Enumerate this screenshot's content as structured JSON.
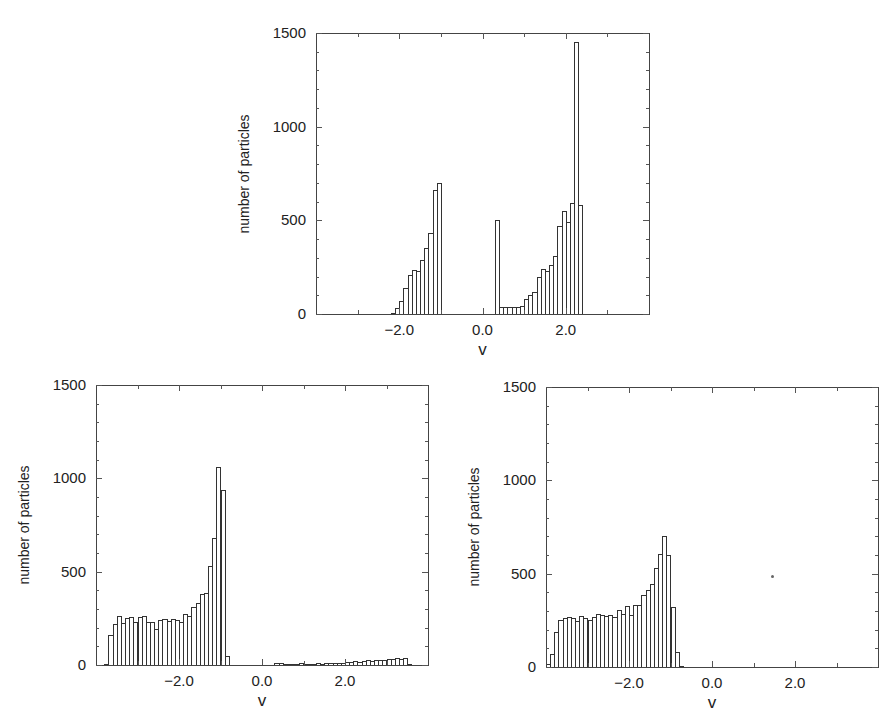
{
  "chart_data": [
    {
      "id": "top",
      "type": "bar",
      "title": "",
      "xlabel": "v",
      "ylabel": "number of particles",
      "xlim": [
        -4,
        4
      ],
      "ylim": [
        0,
        1500
      ],
      "grid": false,
      "xticks": [
        -2.0,
        0.0,
        2.0
      ],
      "xtick_labels": [
        "−2.0",
        "0.0",
        "2.0"
      ],
      "yticks": [
        0,
        500,
        1000,
        1500
      ],
      "ytick_labels": [
        "0",
        "500",
        "1000",
        "1500"
      ],
      "bin_width": 0.1,
      "frame_px": {
        "left": 316,
        "top": 33,
        "right": 649,
        "bottom": 314
      },
      "x": [
        -2.15,
        -2.05,
        -1.95,
        -1.85,
        -1.75,
        -1.65,
        -1.55,
        -1.45,
        -1.35,
        -1.25,
        -1.15,
        -1.05,
        0.35,
        0.45,
        0.55,
        0.65,
        0.75,
        0.85,
        0.95,
        1.05,
        1.15,
        1.25,
        1.35,
        1.45,
        1.55,
        1.65,
        1.75,
        1.85,
        1.95,
        2.05,
        2.15,
        2.25,
        2.35
      ],
      "values": [
        5,
        30,
        70,
        140,
        210,
        235,
        230,
        290,
        350,
        430,
        660,
        700,
        500,
        40,
        38,
        40,
        40,
        40,
        45,
        80,
        100,
        120,
        200,
        240,
        230,
        260,
        310,
        470,
        550,
        490,
        590,
        1450,
        580
      ]
    },
    {
      "id": "bottom-left",
      "type": "bar",
      "title": "",
      "xlabel": "v",
      "ylabel": "number of particles",
      "xlim": [
        -4,
        4
      ],
      "ylim": [
        0,
        1500
      ],
      "grid": false,
      "xticks": [
        -2.0,
        0.0,
        2.0
      ],
      "xtick_labels": [
        "−2.0",
        "0.0",
        "2.0"
      ],
      "yticks": [
        0,
        500,
        1000,
        1500
      ],
      "ytick_labels": [
        "0",
        "500",
        "1000",
        "1500"
      ],
      "bin_width": 0.1,
      "frame_px": {
        "left": 96,
        "top": 385,
        "right": 428,
        "bottom": 665
      },
      "x": [
        -3.75,
        -3.65,
        -3.55,
        -3.45,
        -3.35,
        -3.25,
        -3.15,
        -3.05,
        -2.95,
        -2.85,
        -2.75,
        -2.65,
        -2.55,
        -2.45,
        -2.35,
        -2.25,
        -2.15,
        -2.05,
        -1.95,
        -1.85,
        -1.75,
        -1.65,
        -1.55,
        -1.45,
        -1.35,
        -1.25,
        -1.15,
        -1.05,
        -0.95,
        -0.85,
        0.35,
        0.45,
        0.55,
        0.65,
        0.75,
        0.85,
        0.95,
        1.05,
        1.15,
        1.25,
        1.35,
        1.45,
        1.55,
        1.65,
        1.75,
        1.85,
        1.95,
        2.05,
        2.15,
        2.25,
        2.35,
        2.45,
        2.55,
        2.65,
        2.75,
        2.85,
        2.95,
        3.05,
        3.15,
        3.25,
        3.35,
        3.45,
        3.55
      ],
      "values": [
        5,
        160,
        220,
        260,
        225,
        250,
        255,
        230,
        255,
        265,
        230,
        230,
        195,
        240,
        245,
        235,
        245,
        240,
        230,
        275,
        265,
        310,
        330,
        380,
        385,
        530,
        680,
        1060,
        940,
        50,
        10,
        12,
        8,
        6,
        5,
        8,
        10,
        6,
        5,
        8,
        10,
        8,
        10,
        12,
        10,
        12,
        12,
        15,
        18,
        20,
        18,
        22,
        25,
        22,
        25,
        28,
        25,
        30,
        32,
        35,
        30,
        35,
        8
      ]
    },
    {
      "id": "bottom-right",
      "type": "bar",
      "title": "",
      "xlabel": "v",
      "ylabel": "number of particles",
      "xlim": [
        -4,
        4
      ],
      "ylim": [
        0,
        1500
      ],
      "grid": false,
      "xticks": [
        -2.0,
        0.0,
        2.0
      ],
      "xtick_labels": [
        "−2.0",
        "0.0",
        "2.0"
      ],
      "yticks": [
        0,
        500,
        1000,
        1500
      ],
      "ytick_labels": [
        "0",
        "500",
        "1000",
        "1500"
      ],
      "bin_width": 0.1,
      "frame_px": {
        "left": 546,
        "top": 387,
        "right": 878,
        "bottom": 667
      },
      "x": [
        -3.95,
        -3.85,
        -3.75,
        -3.65,
        -3.55,
        -3.45,
        -3.35,
        -3.25,
        -3.15,
        -3.05,
        -2.95,
        -2.85,
        -2.75,
        -2.65,
        -2.55,
        -2.45,
        -2.35,
        -2.25,
        -2.15,
        -2.05,
        -1.95,
        -1.85,
        -1.75,
        -1.65,
        -1.55,
        -1.45,
        -1.35,
        -1.25,
        -1.15,
        -1.05,
        -0.95,
        -0.85,
        -0.75,
        -0.65
      ],
      "values": [
        15,
        70,
        190,
        250,
        260,
        270,
        260,
        245,
        275,
        260,
        250,
        270,
        285,
        280,
        275,
        280,
        270,
        305,
        285,
        325,
        280,
        330,
        330,
        385,
        415,
        445,
        530,
        605,
        700,
        600,
        320,
        80,
        5,
        0
      ]
    }
  ],
  "panels": [
    {
      "ylabel": "number of particles",
      "xlabel": "v"
    },
    {
      "ylabel": "number of particles",
      "xlabel": "v"
    },
    {
      "ylabel": "number of particles",
      "xlabel": "v"
    }
  ]
}
